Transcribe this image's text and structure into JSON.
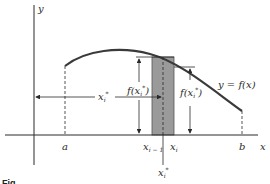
{
  "diagram": {
    "type": "riemann-sum-rectangle",
    "axes": {
      "x_label": "x",
      "y_label": "y"
    },
    "curve_label": "y = f(x)",
    "interval": {
      "start_label": "a",
      "end_label": "b"
    },
    "subinterval": {
      "left_label": "x",
      "left_sub": "i − 1",
      "right_label": "x",
      "right_sub": "i"
    },
    "sample_points": {
      "left_point": {
        "label": "x",
        "sub": "i",
        "sup": "*"
      },
      "right_point": {
        "label": "x",
        "sub": "i",
        "sup": "*"
      },
      "height_left": {
        "prefix": "f(x",
        "sub": "i",
        "sup": "*",
        "suffix": ")"
      },
      "height_right": {
        "prefix": "f(x",
        "sub": "i",
        "sup": "*",
        "suffix": ")"
      }
    },
    "caption": "Fig."
  },
  "colors": {
    "line": "#2a2a2a",
    "curve": "#3a3a3a",
    "rectangle_fill": "#9a9a9a",
    "background": "#ffffff"
  }
}
